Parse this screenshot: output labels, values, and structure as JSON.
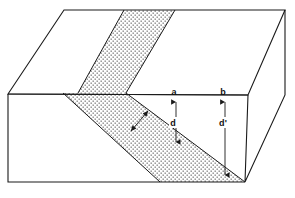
{
  "figure": {
    "kind": "geological-block-diagram",
    "title": "",
    "background_color": "#ffffff",
    "line_color": "#1a1a1a",
    "bed_fill": "stipple-dots"
  },
  "labels": [
    {
      "id": "point-a",
      "text": "a",
      "x": 174,
      "y": 95,
      "role": "surface-point"
    },
    {
      "id": "point-b",
      "text": "b",
      "x": 223,
      "y": 95,
      "role": "surface-point"
    },
    {
      "id": "depth-d",
      "text": "d",
      "x": 174,
      "y": 124,
      "role": "depth-measure"
    },
    {
      "id": "depth-d-prime",
      "text": "d'",
      "x": 223,
      "y": 124,
      "role": "depth-measure"
    }
  ],
  "measures": [
    {
      "id": "d-arrow",
      "label": "d",
      "from_x": 176,
      "from_y": 101,
      "to_x": 176,
      "to_y": 143,
      "double_headed": true
    },
    {
      "id": "d-prime-arrow",
      "label": "d'",
      "from_x": 225,
      "from_y": 101,
      "to_x": 225,
      "to_y": 176,
      "double_headed": true
    },
    {
      "id": "thickness-arrow",
      "label": "",
      "from_x": 148,
      "from_y": 112,
      "to_x": 130,
      "to_y": 132,
      "double_headed": true
    }
  ],
  "geometry": {
    "top_face": "M 8,94 L 64,10 L 285,10 L 248,95 Z",
    "front_face": "M 8,94 L 248,95 L 245,182 L 8,182 Z",
    "right_face": "M 248,95 L 285,10 L 285,95 L 245,182 Z",
    "bed_top_face": "M 78,93 L 124,10 L 175,10 L 126,93 Z",
    "bed_front_face": "M 63,93 L 126,93 L 245,182 L 160,182 Z"
  },
  "annotation_notes": {
    "surface_points_edge": "front-top edge of block",
    "bed_name": "inclined stippled bed"
  }
}
